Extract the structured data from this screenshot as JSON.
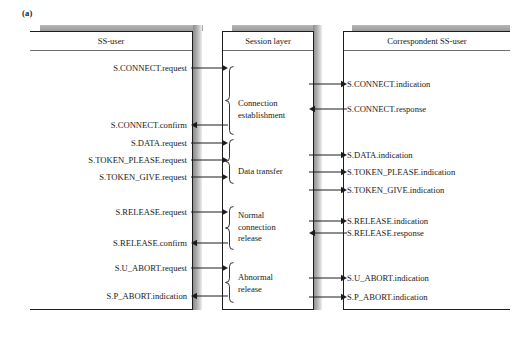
{
  "figure": {
    "label": "(a)",
    "caption_panels": 3
  },
  "panels": {
    "left": {
      "title": "SS-user"
    },
    "middle": {
      "title": "Session layer"
    },
    "right": {
      "title": "Correspondent SS-user"
    }
  },
  "left_primitives": [
    {
      "label": "S.CONNECT.request",
      "direction": "right",
      "y": 68
    },
    {
      "label": "S.CONNECT.confirm",
      "direction": "left",
      "y": 125
    },
    {
      "label": "S.DATA.request",
      "direction": "right",
      "y": 143
    },
    {
      "label": "S.TOKEN_PLEASE.request",
      "direction": "right",
      "y": 160
    },
    {
      "label": "S.TOKEN_GIVE.request",
      "direction": "right",
      "y": 177
    },
    {
      "label": "S.RELEASE.request",
      "direction": "right",
      "y": 212
    },
    {
      "label": "S.RELEASE.confirm",
      "direction": "left",
      "y": 243
    },
    {
      "label": "S.U_ABORT.request",
      "direction": "right",
      "y": 268
    },
    {
      "label": "S.P_ABORT.indication",
      "direction": "left",
      "y": 296
    }
  ],
  "right_primitives": [
    {
      "label": "S.CONNECT.indication",
      "direction": "right",
      "y": 84
    },
    {
      "label": "S.CONNECT.response",
      "direction": "left",
      "y": 109
    },
    {
      "label": "S.DATA.indication",
      "direction": "right",
      "y": 155
    },
    {
      "label": "S.TOKEN_PLEASE.indication",
      "direction": "right",
      "y": 172
    },
    {
      "label": "S.TOKEN_GIVE.indication",
      "direction": "right",
      "y": 190
    },
    {
      "label": "S.RELEASE.indication",
      "direction": "right",
      "y": 221
    },
    {
      "label": "S.RELEASE.response",
      "direction": "left",
      "y": 233
    },
    {
      "label": "S.U_ABORT.indication",
      "direction": "right",
      "y": 278
    },
    {
      "label": "S.P_ABORT.indication",
      "direction": "right",
      "y": 297
    }
  ],
  "phases": [
    {
      "label": "Connection\nestablishment",
      "top": 66,
      "bottom": 135,
      "label_y": 98
    },
    {
      "label": "Data transfer",
      "top": 139,
      "bottom": 184,
      "label_y": 166
    },
    {
      "label": "Normal\nconnection\nrelease",
      "top": 206,
      "bottom": 250,
      "label_y": 210
    },
    {
      "label": "Abnormal\nrelease",
      "top": 262,
      "bottom": 303,
      "label_y": 272
    }
  ],
  "colors": {
    "stroke": "#1c1c1c",
    "header_rule": "#6d6d6d",
    "shadow_dark": "#8d8d8d",
    "shadow_light": "#efefef",
    "background": "#ffffff",
    "text": "#191919"
  }
}
